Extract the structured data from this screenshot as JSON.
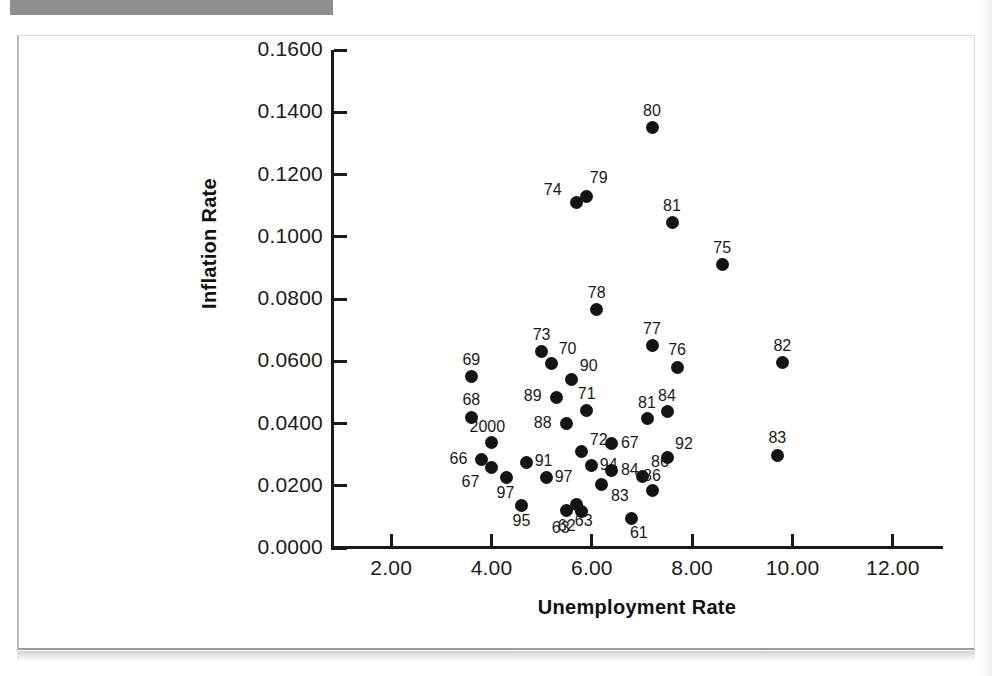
{
  "figure": {
    "x_axis_title": "Unemployment Rate",
    "y_axis_title": "Inflation Rate"
  },
  "chart_data": {
    "type": "scatter",
    "title": "",
    "xlabel": "Unemployment Rate",
    "ylabel": "Inflation Rate",
    "xlim": [
      0.8,
      13.0
    ],
    "ylim": [
      0.0,
      0.16
    ],
    "xticks": [
      "2.00",
      "4.00",
      "6.00",
      "8.00",
      "10.00",
      "12.00"
    ],
    "xtick_values": [
      2,
      4,
      6,
      8,
      10,
      12
    ],
    "yticks": [
      "0.0000",
      "0.0200",
      "0.0400",
      "0.0600",
      "0.0800",
      "0.1000",
      "0.1200",
      "0.1400",
      "0.1600"
    ],
    "ytick_values": [
      0.0,
      0.02,
      0.04,
      0.06,
      0.08,
      0.1,
      0.12,
      0.14,
      0.16
    ],
    "grid": false,
    "legend": false,
    "point_label_field": "year",
    "points": [
      {
        "label": "80",
        "x": 7.2,
        "y": 0.135,
        "lx": -9,
        "ly": -25
      },
      {
        "label": "74",
        "x": 5.7,
        "y": 0.111,
        "lx": -33,
        "ly": -21
      },
      {
        "label": "79",
        "x": 5.9,
        "y": 0.113,
        "lx": 3,
        "ly": -26
      },
      {
        "label": "81",
        "x": 7.6,
        "y": 0.1045,
        "lx": -9,
        "ly": -25
      },
      {
        "label": "75",
        "x": 8.6,
        "y": 0.091,
        "lx": -9,
        "ly": -25
      },
      {
        "label": "78",
        "x": 6.1,
        "y": 0.0765,
        "lx": -9,
        "ly": -25
      },
      {
        "label": "77",
        "x": 7.2,
        "y": 0.065,
        "lx": -9,
        "ly": -25
      },
      {
        "label": "73",
        "x": 5.0,
        "y": 0.063,
        "lx": -9,
        "ly": -25
      },
      {
        "label": "70",
        "x": 5.2,
        "y": 0.0592,
        "lx": 7,
        "ly": -23
      },
      {
        "label": "76",
        "x": 7.7,
        "y": 0.058,
        "lx": -9,
        "ly": -25
      },
      {
        "label": "82",
        "x": 9.8,
        "y": 0.0595,
        "lx": -9,
        "ly": -25
      },
      {
        "label": "69",
        "x": 3.6,
        "y": 0.055,
        "lx": -9,
        "ly": -25
      },
      {
        "label": "90",
        "x": 5.6,
        "y": 0.054,
        "lx": 8,
        "ly": -22
      },
      {
        "label": "89",
        "x": 5.3,
        "y": 0.0484,
        "lx": -33,
        "ly": -9
      },
      {
        "label": "71",
        "x": 5.9,
        "y": 0.0443,
        "lx": -9,
        "ly": -24
      },
      {
        "label": "84",
        "x": 7.5,
        "y": 0.0437,
        "lx": -9,
        "ly": -24
      },
      {
        "label": "81",
        "x": 7.1,
        "y": 0.0415,
        "lx": -9,
        "ly": -24
      },
      {
        "label": "68",
        "x": 3.6,
        "y": 0.042,
        "lx": -9,
        "ly": -25
      },
      {
        "label": "88",
        "x": 5.5,
        "y": 0.04,
        "lx": -33,
        "ly": -9
      },
      {
        "label": "2000",
        "x": 4.0,
        "y": 0.0338,
        "lx": -22,
        "ly": -24
      },
      {
        "label": "92",
        "x": 7.5,
        "y": 0.029,
        "lx": 8,
        "ly": -22
      },
      {
        "label": "67",
        "x": 6.4,
        "y": 0.0335,
        "lx": 9,
        "ly": -9
      },
      {
        "label": "72",
        "x": 5.8,
        "y": 0.031,
        "lx": 8,
        "ly": -20
      },
      {
        "label": "66",
        "x": 3.8,
        "y": 0.0285,
        "lx": -32,
        "ly": -8
      },
      {
        "label": "67",
        "x": 4.0,
        "y": 0.026,
        "lx": -30,
        "ly": 7
      },
      {
        "label": "94",
        "x": 6.0,
        "y": 0.0265,
        "lx": 8,
        "ly": -9
      },
      {
        "label": "91",
        "x": 4.7,
        "y": 0.0275,
        "lx": 8,
        "ly": -9
      },
      {
        "label": "83",
        "x": 9.7,
        "y": 0.0298,
        "lx": -9,
        "ly": -25
      },
      {
        "label": "84",
        "x": 6.4,
        "y": 0.025,
        "lx": 9,
        "ly": -8
      },
      {
        "label": "86",
        "x": 7.0,
        "y": 0.023,
        "lx": 9,
        "ly": -22
      },
      {
        "label": "97",
        "x": 4.3,
        "y": 0.0225,
        "lx": -10,
        "ly": 7
      },
      {
        "label": "97",
        "x": 5.1,
        "y": 0.0228,
        "lx": 8,
        "ly": -8
      },
      {
        "label": "83",
        "x": 6.2,
        "y": 0.0205,
        "lx": 9,
        "ly": 4
      },
      {
        "label": "86",
        "x": 7.2,
        "y": 0.0185,
        "lx": -9,
        "ly": -22
      },
      {
        "label": "95",
        "x": 4.6,
        "y": 0.0135,
        "lx": -9,
        "ly": 7
      },
      {
        "label": "62",
        "x": 5.5,
        "y": 0.0122,
        "lx": -9,
        "ly": 8
      },
      {
        "label": "63",
        "x": 5.7,
        "y": 0.014,
        "lx": -2,
        "ly": 9
      },
      {
        "label": "63",
        "x": 5.8,
        "y": 0.0118,
        "lx": -30,
        "ly": 9
      },
      {
        "label": "61",
        "x": 6.8,
        "y": 0.0095,
        "lx": -2,
        "ly": 7
      }
    ]
  }
}
